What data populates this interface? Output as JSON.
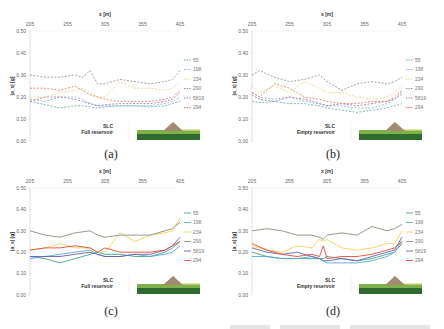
{
  "chart_data": [
    {
      "id": "a",
      "type": "line",
      "caption": "(a)",
      "title": "",
      "xlabel": "x [m]",
      "ylabel": "|a_s| [g]",
      "x_ticks": [
        "205",
        "255",
        "305",
        "355",
        "405"
      ],
      "y_ticks": [
        "0.00",
        "0.10",
        "0.20",
        "0.30",
        "0.40",
        "0.50"
      ],
      "xlim": [
        205,
        405
      ],
      "ylim": [
        0,
        0.5
      ],
      "line_style": "dashed",
      "annotation": [
        "SLC",
        "Full reservoir"
      ],
      "x": [
        205,
        225,
        245,
        265,
        275,
        285,
        295,
        305,
        325,
        345,
        365,
        385,
        395,
        405
      ],
      "series": [
        {
          "name": "55",
          "color": "#5aa7a0",
          "values": [
            0.18,
            0.165,
            0.15,
            0.16,
            0.16,
            0.155,
            0.15,
            0.155,
            0.16,
            0.16,
            0.155,
            0.16,
            0.17,
            0.18
          ]
        },
        {
          "name": "198",
          "color": "#7fb0d8",
          "values": [
            0.19,
            0.18,
            0.2,
            0.2,
            0.19,
            0.17,
            0.16,
            0.16,
            0.16,
            0.16,
            0.16,
            0.17,
            0.18,
            0.2
          ]
        },
        {
          "name": "234",
          "color": "#e8d27a",
          "values": [
            0.2,
            0.2,
            0.22,
            0.23,
            0.24,
            0.22,
            0.2,
            0.2,
            0.27,
            0.24,
            0.24,
            0.23,
            0.24,
            0.27
          ]
        },
        {
          "name": "290",
          "color": "#8c8c8c",
          "values": [
            0.3,
            0.29,
            0.29,
            0.3,
            0.29,
            0.32,
            0.26,
            0.26,
            0.28,
            0.27,
            0.26,
            0.27,
            0.28,
            0.32
          ]
        },
        {
          "name": "5819",
          "color": "#9a6fa8",
          "values": [
            0.18,
            0.2,
            0.2,
            0.19,
            0.18,
            0.17,
            0.16,
            0.165,
            0.17,
            0.17,
            0.17,
            0.18,
            0.19,
            0.22
          ]
        },
        {
          "name": "294",
          "color": "#e0735f",
          "values": [
            0.24,
            0.24,
            0.23,
            0.25,
            0.23,
            0.21,
            0.2,
            0.19,
            0.18,
            0.18,
            0.18,
            0.19,
            0.2,
            0.23
          ]
        }
      ]
    },
    {
      "id": "b",
      "type": "line",
      "caption": "(b)",
      "title": "",
      "xlabel": "x [m]",
      "ylabel": "|a_s| [g]",
      "x_ticks": [
        "205",
        "255",
        "305",
        "355",
        "405"
      ],
      "y_ticks": [
        "0.00",
        "0.10",
        "0.20",
        "0.30",
        "0.40",
        "0.50"
      ],
      "xlim": [
        205,
        405
      ],
      "ylim": [
        0,
        0.5
      ],
      "line_style": "dashed",
      "annotation": [
        "SLC",
        "Empty reservoir"
      ],
      "x": [
        205,
        215,
        235,
        255,
        275,
        295,
        305,
        325,
        345,
        365,
        385,
        395,
        405
      ],
      "series": [
        {
          "name": "55",
          "color": "#5aa7a0",
          "values": [
            0.18,
            0.175,
            0.18,
            0.17,
            0.17,
            0.16,
            0.15,
            0.14,
            0.13,
            0.14,
            0.15,
            0.16,
            0.17
          ]
        },
        {
          "name": "198",
          "color": "#7fb0d8",
          "values": [
            0.22,
            0.2,
            0.19,
            0.2,
            0.18,
            0.17,
            0.16,
            0.16,
            0.15,
            0.15,
            0.17,
            0.19,
            0.21
          ]
        },
        {
          "name": "234",
          "color": "#e8d27a",
          "values": [
            0.25,
            0.22,
            0.25,
            0.22,
            0.27,
            0.24,
            0.22,
            0.22,
            0.2,
            0.19,
            0.2,
            0.22,
            0.25
          ]
        },
        {
          "name": "290",
          "color": "#8c8c8c",
          "values": [
            0.3,
            0.32,
            0.29,
            0.27,
            0.28,
            0.3,
            0.27,
            0.23,
            0.26,
            0.27,
            0.26,
            0.27,
            0.29
          ]
        },
        {
          "name": "5819",
          "color": "#9a6fa8",
          "values": [
            0.21,
            0.19,
            0.18,
            0.2,
            0.19,
            0.17,
            0.16,
            0.17,
            0.16,
            0.17,
            0.18,
            0.19,
            0.22
          ]
        },
        {
          "name": "294",
          "color": "#e0735f",
          "values": [
            0.22,
            0.2,
            0.26,
            0.24,
            0.2,
            0.19,
            0.18,
            0.17,
            0.17,
            0.18,
            0.18,
            0.2,
            0.23
          ]
        }
      ]
    },
    {
      "id": "c",
      "type": "line",
      "caption": "(c)",
      "title": "",
      "xlabel": "x [m]",
      "ylabel": "|a_s| [g]",
      "x_ticks": [
        "205",
        "255",
        "305",
        "355",
        "405"
      ],
      "y_ticks": [
        "0.00",
        "0.10",
        "0.20",
        "0.30",
        "0.40",
        "0.50"
      ],
      "xlim": [
        205,
        405
      ],
      "ylim": [
        0,
        0.5
      ],
      "line_style": "solid",
      "annotation": [
        "SLC",
        "Full reservoir"
      ],
      "x": [
        205,
        225,
        245,
        265,
        285,
        295,
        305,
        325,
        345,
        365,
        385,
        395,
        405
      ],
      "series": [
        {
          "name": "55",
          "color": "#4aa38c",
          "values": [
            0.18,
            0.17,
            0.15,
            0.17,
            0.19,
            0.2,
            0.19,
            0.19,
            0.18,
            0.18,
            0.2,
            0.22,
            0.25
          ]
        },
        {
          "name": "198",
          "color": "#5aa9d6",
          "values": [
            0.17,
            0.18,
            0.19,
            0.2,
            0.21,
            0.19,
            0.18,
            0.18,
            0.19,
            0.18,
            0.19,
            0.2,
            0.23
          ]
        },
        {
          "name": "234",
          "color": "#f0d35a",
          "values": [
            0.21,
            0.22,
            0.24,
            0.22,
            0.22,
            0.2,
            0.2,
            0.29,
            0.25,
            0.28,
            0.29,
            0.3,
            0.36
          ]
        },
        {
          "name": "290",
          "color": "#8f8f7f",
          "values": [
            0.3,
            0.28,
            0.27,
            0.29,
            0.3,
            0.28,
            0.27,
            0.28,
            0.28,
            0.28,
            0.3,
            0.31,
            0.34
          ]
        },
        {
          "name": "5819",
          "color": "#6f5fa8",
          "values": [
            0.18,
            0.18,
            0.18,
            0.19,
            0.2,
            0.19,
            0.18,
            0.18,
            0.19,
            0.19,
            0.21,
            0.23,
            0.27
          ]
        },
        {
          "name": "294",
          "color": "#e04a3a",
          "values": [
            0.21,
            0.22,
            0.22,
            0.23,
            0.22,
            0.2,
            0.22,
            0.2,
            0.2,
            0.2,
            0.21,
            0.23,
            0.25
          ]
        }
      ]
    },
    {
      "id": "d",
      "type": "line",
      "caption": "(d)",
      "title": "",
      "xlabel": "x [m]",
      "ylabel": "|a_s| [g]",
      "x_ticks": [
        "205",
        "255",
        "305",
        "355",
        "405"
      ],
      "y_ticks": [
        "0.00",
        "0.10",
        "0.20",
        "0.30",
        "0.40",
        "0.50"
      ],
      "xlim": [
        205,
        405
      ],
      "ylim": [
        0,
        0.5
      ],
      "line_style": "solid",
      "annotation": [
        "SLC",
        "Empty reservoir"
      ],
      "x": [
        205,
        225,
        245,
        265,
        285,
        295,
        300,
        305,
        325,
        345,
        365,
        385,
        395,
        405
      ],
      "series": [
        {
          "name": "55",
          "color": "#4aa38c",
          "values": [
            0.2,
            0.18,
            0.17,
            0.17,
            0.17,
            0.17,
            0.17,
            0.18,
            0.17,
            0.16,
            0.17,
            0.19,
            0.2,
            0.24
          ]
        },
        {
          "name": "198",
          "color": "#5aa9d6",
          "values": [
            0.18,
            0.18,
            0.17,
            0.17,
            0.18,
            0.17,
            0.16,
            0.15,
            0.15,
            0.15,
            0.16,
            0.18,
            0.2,
            0.25
          ]
        },
        {
          "name": "234",
          "color": "#f0d35a",
          "values": [
            0.23,
            0.21,
            0.2,
            0.23,
            0.22,
            0.26,
            0.25,
            0.26,
            0.22,
            0.21,
            0.22,
            0.24,
            0.24,
            0.3
          ]
        },
        {
          "name": "290",
          "color": "#8f8f7f",
          "values": [
            0.3,
            0.31,
            0.3,
            0.28,
            0.28,
            0.27,
            0.26,
            0.28,
            0.29,
            0.28,
            0.32,
            0.3,
            0.31,
            0.33
          ]
        },
        {
          "name": "5819",
          "color": "#6f5fa8",
          "values": [
            0.22,
            0.2,
            0.19,
            0.2,
            0.18,
            0.17,
            0.16,
            0.16,
            0.17,
            0.16,
            0.18,
            0.2,
            0.21,
            0.27
          ]
        },
        {
          "name": "294",
          "color": "#e04a3a",
          "values": [
            0.24,
            0.21,
            0.19,
            0.18,
            0.19,
            0.18,
            0.23,
            0.17,
            0.18,
            0.18,
            0.19,
            0.21,
            0.22,
            0.25
          ]
        }
      ]
    }
  ]
}
